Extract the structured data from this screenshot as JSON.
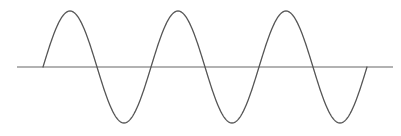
{
  "diagram": {
    "type": "sine-wave",
    "width": 401,
    "height": 136,
    "background": "#ffffff",
    "stroke_color": "#555555",
    "axis_color": "#666666",
    "stroke_width": 1.3,
    "baseline": {
      "y": 67,
      "x_start": 17,
      "x_end": 393
    },
    "wave": {
      "x_start": 43,
      "x_end": 367,
      "period_px": 108,
      "amplitude_px": 56,
      "cycles": 3,
      "start_phase": "rising-from-zero",
      "peaks_x": [
        70,
        178,
        286
      ],
      "troughs_x": [
        124,
        232,
        340
      ],
      "zero_crossings_x": [
        43,
        97,
        151,
        205,
        259,
        313,
        367
      ]
    }
  },
  "chart_data": {
    "type": "line",
    "title": "",
    "xlabel": "",
    "ylabel": "",
    "grid": false,
    "legend": null,
    "function": "y = sin(x)",
    "x": [
      0,
      0.5,
      1,
      1.5,
      2,
      2.5,
      3,
      3.5,
      4,
      4.5,
      5,
      5.5,
      6
    ],
    "x_units": "pi radians",
    "y": [
      0,
      1,
      0,
      -1,
      0,
      1,
      0,
      -1,
      0,
      1,
      0,
      -1,
      0
    ],
    "ylim": [
      -1,
      1
    ]
  }
}
